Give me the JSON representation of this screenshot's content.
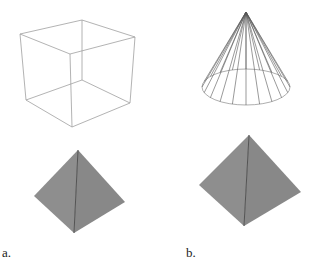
{
  "figure": {
    "panels": [
      {
        "label": "a.",
        "top_shape": "wireframe cube",
        "bottom_shape": "shaded tetrahedron (pyramid)"
      },
      {
        "label": "b.",
        "top_shape": "wireframe cone",
        "bottom_shape": "shaded tetrahedron (pyramid)"
      }
    ],
    "colors": {
      "wire_cube": "#9a9a9a",
      "wire_cone": "#555555",
      "pyramid_fill": "#8c8c8c",
      "pyramid_ridge": "#4a4a4a",
      "background": "#ffffff"
    },
    "cone_segments": 20
  }
}
